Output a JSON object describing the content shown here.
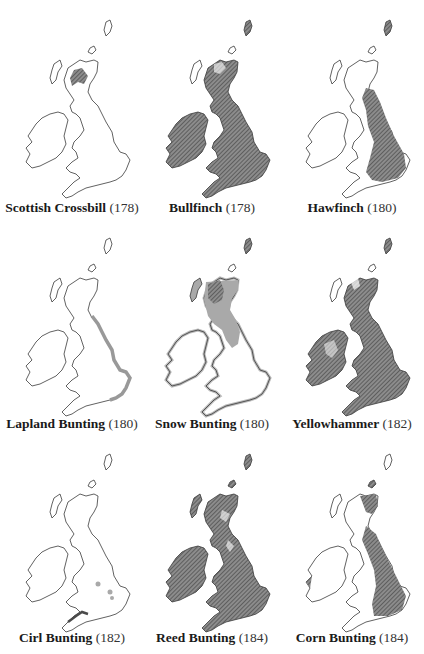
{
  "colors": {
    "outline": "#3a3a3a",
    "hatch": "#6e6e6e",
    "hatch_bg": "#8a8a8a",
    "light_fill": "#a9a9a9",
    "paper": "#ffffff"
  },
  "maps": [
    {
      "name": "Scottish Crossbill",
      "page": "(178)",
      "pattern": "patch-scotland"
    },
    {
      "name": "Bullfinch",
      "page": "(178)",
      "pattern": "full-hatch"
    },
    {
      "name": "Hawfinch",
      "page": "(180)",
      "pattern": "england-hatch"
    },
    {
      "name": "Lapland Bunting",
      "page": "(180)",
      "pattern": "east-coast"
    },
    {
      "name": "Snow Bunting",
      "page": "(180)",
      "pattern": "north-light"
    },
    {
      "name": "Yellowhammer",
      "page": "(182)",
      "pattern": "full-hatch"
    },
    {
      "name": "Cirl Bunting",
      "page": "(182)",
      "pattern": "southwest-dots"
    },
    {
      "name": "Reed Bunting",
      "page": "(184)",
      "pattern": "full-hatch"
    },
    {
      "name": "Corn Bunting",
      "page": "(184)",
      "pattern": "east-hatch"
    }
  ]
}
